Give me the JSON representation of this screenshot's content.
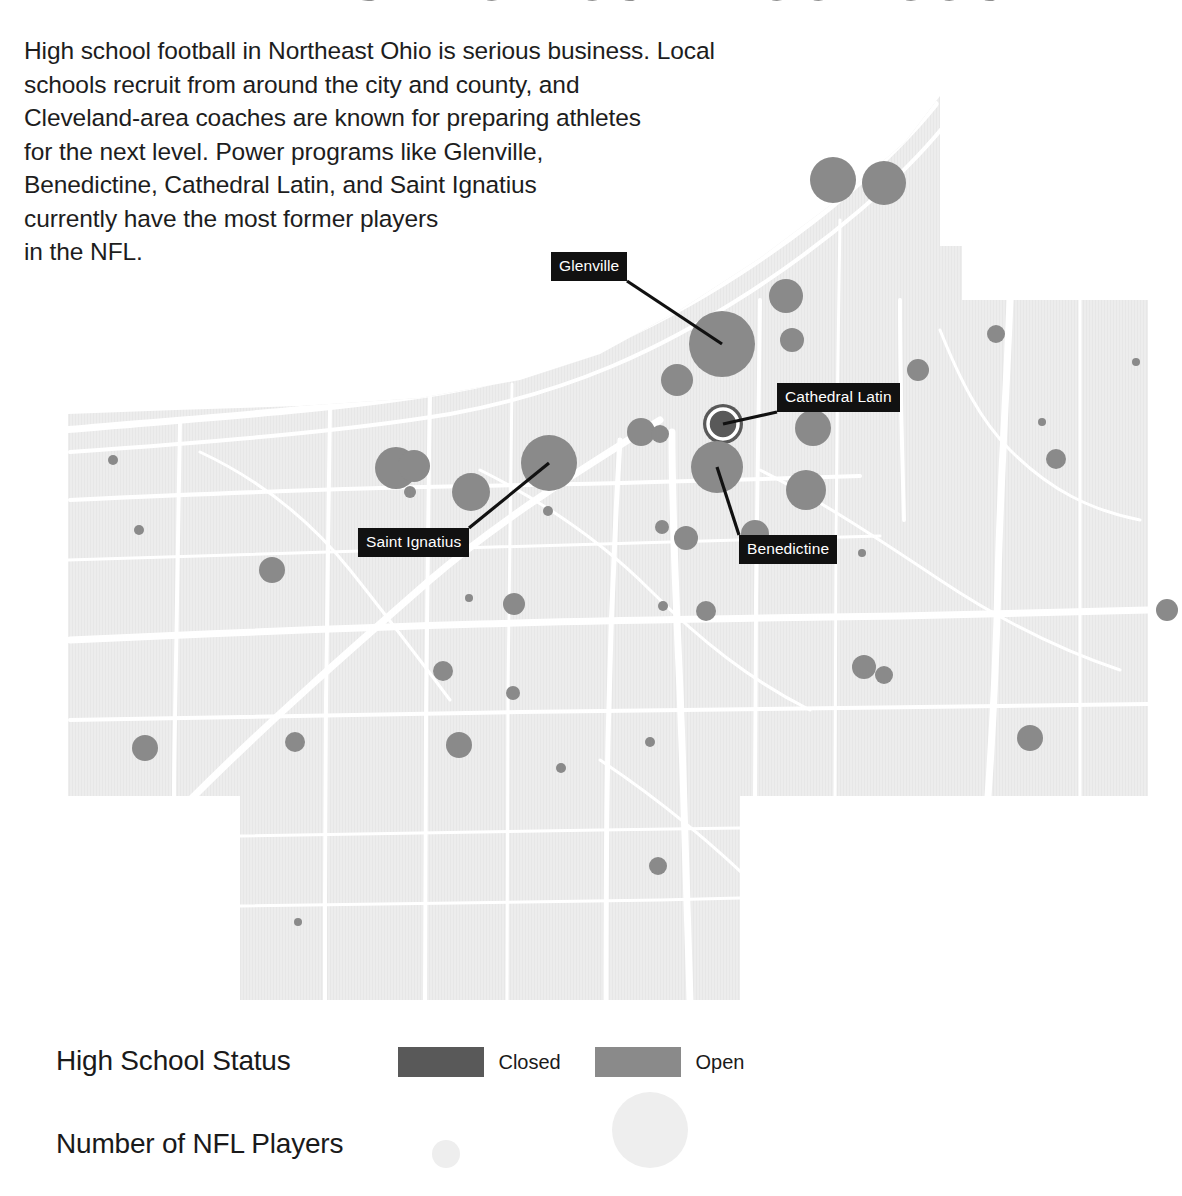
{
  "header": {
    "title": "NFL PLAYERS FROM CUYAHOGA COUNTY",
    "intro": "High school football in Northeast Ohio is serious business. Local\nschools recruit from around the city and county, and\nCleveland-area coaches are known for preparing athletes\nfor the next level. Power programs like Glenville,\nBenedictine, Cathedral Latin, and Saint Ignatius\ncurrently have the most former players\nin the NFL."
  },
  "colors": {
    "page_background": "#ffffff",
    "map_land": "#ededed",
    "map_roads": "#ffffff",
    "marker_open": "#8a8a8a",
    "marker_closed": "#595959",
    "callout_background": "#111111",
    "callout_text": "#ffffff",
    "text": "#1a1a1a",
    "size_legend_circle": "#eeeeee"
  },
  "map": {
    "callouts": [
      {
        "name": "Glenville",
        "label_x": 551,
        "label_y": 252,
        "anchor_x": 722,
        "anchor_y": 344
      },
      {
        "name": "Cathedral Latin",
        "label_x": 777,
        "label_y": 383,
        "anchor_x": 723,
        "anchor_y": 424
      },
      {
        "name": "Saint Ignatius",
        "label_x": 358,
        "label_y": 528,
        "anchor_x": 549,
        "anchor_y": 463
      },
      {
        "name": "Benedictine",
        "label_x": 739,
        "label_y": 535,
        "anchor_x": 717,
        "anchor_y": 467
      }
    ],
    "markers": [
      {
        "x": 833,
        "y": 180,
        "r": 23,
        "status": "open"
      },
      {
        "x": 884,
        "y": 183,
        "r": 22,
        "status": "open"
      },
      {
        "x": 786,
        "y": 296,
        "r": 17,
        "status": "open"
      },
      {
        "x": 722,
        "y": 344,
        "r": 33,
        "status": "open"
      },
      {
        "x": 792,
        "y": 340,
        "r": 12,
        "status": "open"
      },
      {
        "x": 677,
        "y": 380,
        "r": 16,
        "status": "open"
      },
      {
        "x": 918,
        "y": 370,
        "r": 11,
        "status": "open"
      },
      {
        "x": 996,
        "y": 334,
        "r": 9,
        "status": "open"
      },
      {
        "x": 1136,
        "y": 362,
        "r": 4,
        "status": "open"
      },
      {
        "x": 641,
        "y": 432,
        "r": 14,
        "status": "open"
      },
      {
        "x": 660,
        "y": 434,
        "r": 9,
        "status": "open"
      },
      {
        "x": 723,
        "y": 424,
        "r": 20,
        "status": "closed"
      },
      {
        "x": 813,
        "y": 428,
        "r": 18,
        "status": "open"
      },
      {
        "x": 1042,
        "y": 422,
        "r": 4,
        "status": "open"
      },
      {
        "x": 1056,
        "y": 459,
        "r": 10,
        "status": "open"
      },
      {
        "x": 396,
        "y": 468,
        "r": 21,
        "status": "open"
      },
      {
        "x": 414,
        "y": 466,
        "r": 16,
        "status": "open"
      },
      {
        "x": 471,
        "y": 492,
        "r": 19,
        "status": "open"
      },
      {
        "x": 549,
        "y": 463,
        "r": 28,
        "status": "open"
      },
      {
        "x": 410,
        "y": 492,
        "r": 6,
        "status": "open"
      },
      {
        "x": 548,
        "y": 511,
        "r": 5,
        "status": "open"
      },
      {
        "x": 717,
        "y": 467,
        "r": 26,
        "status": "open"
      },
      {
        "x": 806,
        "y": 490,
        "r": 20,
        "status": "open"
      },
      {
        "x": 113,
        "y": 460,
        "r": 5,
        "status": "open"
      },
      {
        "x": 139,
        "y": 530,
        "r": 5,
        "status": "open"
      },
      {
        "x": 662,
        "y": 527,
        "r": 7,
        "status": "open"
      },
      {
        "x": 686,
        "y": 538,
        "r": 12,
        "status": "open"
      },
      {
        "x": 755,
        "y": 534,
        "r": 14,
        "status": "open"
      },
      {
        "x": 272,
        "y": 570,
        "r": 13,
        "status": "open"
      },
      {
        "x": 862,
        "y": 553,
        "r": 4,
        "status": "open"
      },
      {
        "x": 1167,
        "y": 610,
        "r": 11,
        "status": "open"
      },
      {
        "x": 469,
        "y": 598,
        "r": 4,
        "status": "open"
      },
      {
        "x": 514,
        "y": 604,
        "r": 11,
        "status": "open"
      },
      {
        "x": 663,
        "y": 606,
        "r": 5,
        "status": "open"
      },
      {
        "x": 706,
        "y": 611,
        "r": 10,
        "status": "open"
      },
      {
        "x": 443,
        "y": 671,
        "r": 10,
        "status": "open"
      },
      {
        "x": 513,
        "y": 693,
        "r": 7,
        "status": "open"
      },
      {
        "x": 864,
        "y": 667,
        "r": 12,
        "status": "open"
      },
      {
        "x": 884,
        "y": 675,
        "r": 9,
        "status": "open"
      },
      {
        "x": 650,
        "y": 742,
        "r": 5,
        "status": "open"
      },
      {
        "x": 145,
        "y": 748,
        "r": 13,
        "status": "open"
      },
      {
        "x": 295,
        "y": 742,
        "r": 10,
        "status": "open"
      },
      {
        "x": 459,
        "y": 745,
        "r": 13,
        "status": "open"
      },
      {
        "x": 1030,
        "y": 738,
        "r": 13,
        "status": "open"
      },
      {
        "x": 561,
        "y": 768,
        "r": 5,
        "status": "open"
      },
      {
        "x": 658,
        "y": 866,
        "r": 9,
        "status": "open"
      },
      {
        "x": 298,
        "y": 922,
        "r": 4,
        "status": "open"
      }
    ]
  },
  "legend": {
    "status": {
      "title": "High School Status",
      "items": [
        {
          "label": "Closed",
          "color": "#595959"
        },
        {
          "label": "Open",
          "color": "#8a8a8a"
        }
      ]
    },
    "size": {
      "title": "Number of NFL Players",
      "items": [
        {
          "label": "5",
          "r": 14
        },
        {
          "label": "25",
          "r": 38
        }
      ]
    }
  },
  "chart_data": {
    "type": "scatter",
    "title": "NFL PLAYERS FROM CUYAHOGA COUNTY",
    "subtitle": "High school football in Northeast Ohio is serious business.",
    "xlabel": "",
    "ylabel": "",
    "encoding": {
      "size": "Number of NFL Players",
      "color": "High School Status"
    },
    "size_legend": {
      "values": [
        5,
        25
      ],
      "radii_px": [
        14,
        38
      ]
    },
    "color_legend": {
      "Closed": "#595959",
      "Open": "#8a8a8a"
    },
    "annotated_schools": [
      "Glenville",
      "Cathedral Latin",
      "Saint Ignatius",
      "Benedictine"
    ]
  }
}
